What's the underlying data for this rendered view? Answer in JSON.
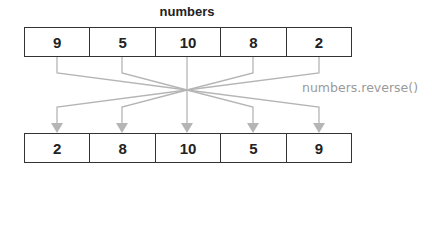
{
  "title": "numbers",
  "method_label": "numbers.reverse()",
  "original": [
    {
      "value": "9"
    },
    {
      "value": "5"
    },
    {
      "value": "10"
    },
    {
      "value": "8"
    },
    {
      "value": "2"
    }
  ],
  "reversed": [
    {
      "value": "2"
    },
    {
      "value": "8"
    },
    {
      "value": "10"
    },
    {
      "value": "5"
    },
    {
      "value": "9"
    }
  ],
  "colors": {
    "line": "#b5b5b5",
    "border": "#333333",
    "label": "#9a9a9a"
  }
}
